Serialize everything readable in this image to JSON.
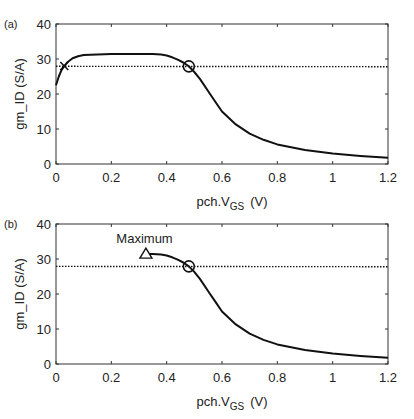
{
  "chart_data": [
    {
      "panel": "(a)",
      "type": "line",
      "xlabel": "pch.V_GS  (V)",
      "xlabel_main": "pch.V",
      "xlabel_sub": "GS",
      "xlabel_unit": "(V)",
      "ylabel": "gm_ID  (S/A)",
      "xlim": [
        0,
        1.2
      ],
      "ylim": [
        0,
        40
      ],
      "xticks": [
        "0",
        "0.2",
        "0.4",
        "0.6",
        "0.8",
        "1",
        "1.2"
      ],
      "yticks": [
        "0",
        "10",
        "20",
        "30",
        "40"
      ],
      "grid": false,
      "series": [
        {
          "name": "gm_ID",
          "style": "solid",
          "x": [
            0,
            0.01,
            0.02,
            0.03,
            0.04,
            0.06,
            0.08,
            0.1,
            0.15,
            0.2,
            0.3,
            0.35,
            0.38,
            0.4,
            0.42,
            0.44,
            0.46,
            0.48,
            0.5,
            0.52,
            0.55,
            0.58,
            0.6,
            0.65,
            0.7,
            0.75,
            0.8,
            0.9,
            1.0,
            1.1,
            1.2
          ],
          "y": [
            22.5,
            25.0,
            26.8,
            28.0,
            29.0,
            30.2,
            30.8,
            31.1,
            31.3,
            31.4,
            31.4,
            31.4,
            31.3,
            31.0,
            30.5,
            29.8,
            29.0,
            27.9,
            26.3,
            24.3,
            20.8,
            17.3,
            15.0,
            11.3,
            8.7,
            6.9,
            5.6,
            4.0,
            3.0,
            2.3,
            1.8
          ]
        },
        {
          "name": "threshold",
          "style": "dotted",
          "x": [
            0,
            1.2
          ],
          "y": [
            27.9,
            27.8
          ]
        }
      ],
      "markers": [
        {
          "shape": "x",
          "x": 0.03,
          "y": 28.0
        },
        {
          "shape": "circle",
          "x": 0.48,
          "y": 27.9
        }
      ]
    },
    {
      "panel": "(b)",
      "type": "line",
      "xlabel": "pch.V_GS  (V)",
      "xlabel_main": "pch.V",
      "xlabel_sub": "GS",
      "xlabel_unit": "(V)",
      "ylabel": "gm_ID  (S/A)",
      "xlim": [
        0,
        1.2
      ],
      "ylim": [
        0,
        40
      ],
      "xticks": [
        "0",
        "0.2",
        "0.4",
        "0.6",
        "0.8",
        "1",
        "1.2"
      ],
      "yticks": [
        "0",
        "10",
        "20",
        "30",
        "40"
      ],
      "grid": false,
      "series": [
        {
          "name": "gm_ID",
          "style": "solid",
          "x": [
            0.32,
            0.35,
            0.38,
            0.4,
            0.42,
            0.44,
            0.46,
            0.48,
            0.5,
            0.52,
            0.55,
            0.58,
            0.6,
            0.65,
            0.7,
            0.75,
            0.8,
            0.9,
            1.0,
            1.1,
            1.2
          ],
          "y": [
            31.4,
            31.4,
            31.3,
            31.0,
            30.5,
            29.8,
            29.0,
            27.9,
            26.3,
            24.3,
            20.8,
            17.3,
            15.0,
            11.3,
            8.7,
            6.9,
            5.6,
            4.0,
            3.0,
            2.3,
            1.8
          ]
        },
        {
          "name": "threshold",
          "style": "dotted",
          "x": [
            0,
            1.2
          ],
          "y": [
            27.9,
            27.8
          ]
        }
      ],
      "markers": [
        {
          "shape": "triangle",
          "x": 0.325,
          "y": 31.4
        },
        {
          "shape": "circle",
          "x": 0.48,
          "y": 27.9
        }
      ],
      "annotations": [
        {
          "text": "Maximum",
          "x": 0.32,
          "y": 34.5
        }
      ]
    }
  ]
}
